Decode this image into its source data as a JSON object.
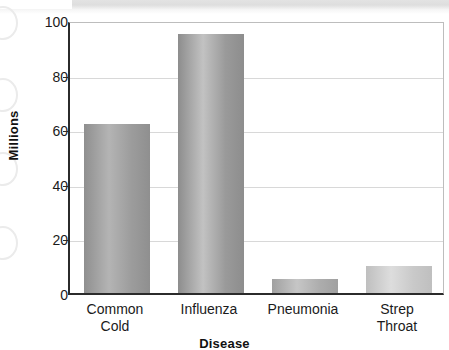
{
  "chart_data": {
    "type": "bar",
    "title": "",
    "subtitle": "",
    "xlabel": "Disease",
    "ylabel": "Millions",
    "categories": [
      "Common Cold",
      "Influenza",
      "Pneumonia",
      "Strep Throat"
    ],
    "category_lines": [
      [
        "Common",
        "Cold"
      ],
      [
        "Influenza"
      ],
      [
        "Pneumonia"
      ],
      [
        "Strep",
        "Throat"
      ]
    ],
    "values": [
      62,
      95,
      5,
      10
    ],
    "ylim": [
      0,
      100
    ],
    "yticks": [
      0,
      20,
      40,
      60,
      80,
      100
    ],
    "ytick_labels": [
      "0",
      "20",
      "40",
      "60",
      "80",
      "100"
    ],
    "grid": "horizontal",
    "legend": "none",
    "bar_colors": [
      "#9c9c9c",
      "#9a9a9a",
      "#adadad",
      "#c9c9c9"
    ],
    "bar_color_light": [
      "#b4b4b4",
      "#c2c2c2",
      "#c6c6c6",
      "#dddddd"
    ],
    "bar_color_dark": [
      "#8f8f8f",
      "#8d8d8d",
      "#a0a0a0",
      "#bfbfbf"
    ]
  },
  "axis": {
    "axis_line_color": "#2b2b2b",
    "grid_color": "#d8d8d8",
    "plot_border_color": "#bdbdbd"
  },
  "artifacts": {
    "scan_band_color": "#e0e0e0",
    "binder_ring_color": "#ebebeb"
  }
}
